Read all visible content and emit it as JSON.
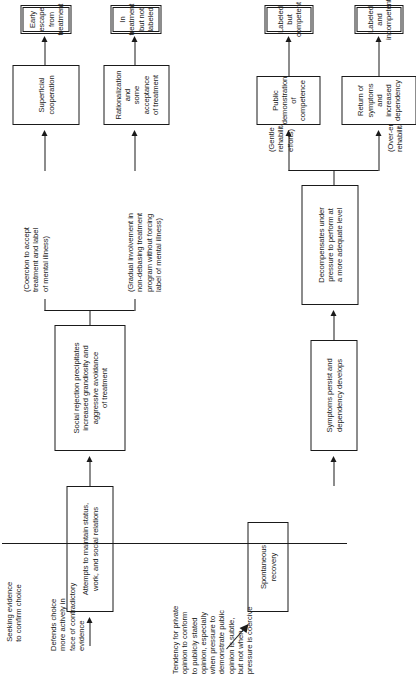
{
  "figure": {
    "nodes": [
      {
        "id": "spontaneous_recovery",
        "label": "Spontaneous\nrecovery"
      },
      {
        "id": "attempts_maintain",
        "label": "Attempts to maintain status,\nwork, and social relations"
      },
      {
        "id": "social_rejection",
        "label": "Social rejection precipitates\nincreased grandiosity and\naggressive avoidance\nof treatment"
      },
      {
        "id": "superficial_cooperation",
        "label": "Superficial cooperation"
      },
      {
        "id": "early_escape",
        "label": "Early escape\nfrom treatment"
      },
      {
        "id": "rationalization",
        "label": "Rationalization and\nsome acceptance\nof treatment"
      },
      {
        "id": "in_treatment",
        "label": "In treatment\nbut not labeled"
      },
      {
        "id": "symptoms_persist",
        "label": "Symptoms persist and\ndependency develops"
      },
      {
        "id": "decompensates",
        "label": "Decompensates under\npressure to perform at\na more adequate level"
      },
      {
        "id": "public_demonstration",
        "label": "Public demonstration\nof competence"
      },
      {
        "id": "labeled_competent",
        "label": "Labeled but\ncompetent"
      },
      {
        "id": "return_symptoms",
        "label": "Return of symptoms\nand\nincreased dependency"
      },
      {
        "id": "labeled_incompetent",
        "label": "Labeled and\nincompetent"
      }
    ],
    "branch_annotations": [
      {
        "id": "coercion",
        "label": "(Coercion to accept\ntreatment and label\nof mental illness)"
      },
      {
        "id": "gradual",
        "label": "(Gradual involvement in\nnon-debasing treatment\nprogram without forcing\nlabel of mental illness)"
      },
      {
        "id": "gentle",
        "label": "(Gentle\nrehabilitative\nefforts)"
      },
      {
        "id": "over_enthusiastic",
        "label": "(Over-enthusiastic\nrehabilitative efforts)"
      }
    ],
    "commentary": [
      {
        "id": "seeking_evidence",
        "label": "Seeking evidence\nto confirm choice"
      },
      {
        "id": "defends_choice",
        "label": "Defends choice\nmore actively in\nface of contradictory\nevidence"
      },
      {
        "id": "tendency_conform",
        "label": "Tendency for private\nopinion to conform\nto publicly stated\nopinion, especially\nwhen pressure to\ndemonstrate public\nopinion is subtle,\nbut not when\npressure is coercive"
      }
    ],
    "colors": {
      "ink": "#1a1a1a",
      "paper": "#ffffff"
    }
  }
}
